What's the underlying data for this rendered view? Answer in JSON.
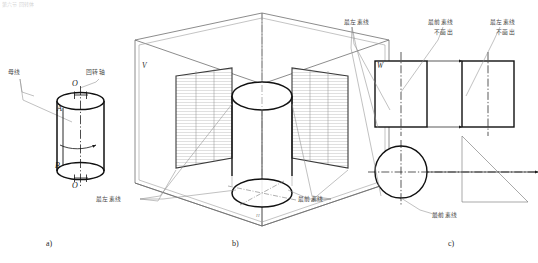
{
  "page": {
    "top_faint_text": "第六节 回转体",
    "background": "#ffffff",
    "line_color": "#1a1a1a",
    "thin_line_color": "#8a8a8a",
    "hatch_color": "#9a9a9a"
  },
  "captions": [
    {
      "id": "a",
      "label": "a)"
    },
    {
      "id": "b",
      "label": "b)"
    },
    {
      "id": "c",
      "label": "c)"
    }
  ],
  "part_a": {
    "title": "圆柱体的形成",
    "labels": {
      "generatrix": "母线",
      "axis": "回转轴"
    },
    "points": {
      "top_axis": "O",
      "upper": "A",
      "lower": "B",
      "bottom_axis": "O"
    }
  },
  "part_b": {
    "title": "三投影面体系中的圆柱",
    "planes": {
      "v": "V",
      "w": "W",
      "h": "H"
    },
    "labels": {
      "leftmost": "最左素线",
      "frontmost": "最前素线"
    }
  },
  "part_c": {
    "title": "圆柱的三视图",
    "labels": {
      "leftmost_top": "最左素线",
      "frontmost_top": "最前素线",
      "frontmost_note": "不画出",
      "leftmost_right": "最左素线",
      "leftmost_right_note": "不画出",
      "frontmost_bottom": "最前素线"
    }
  }
}
